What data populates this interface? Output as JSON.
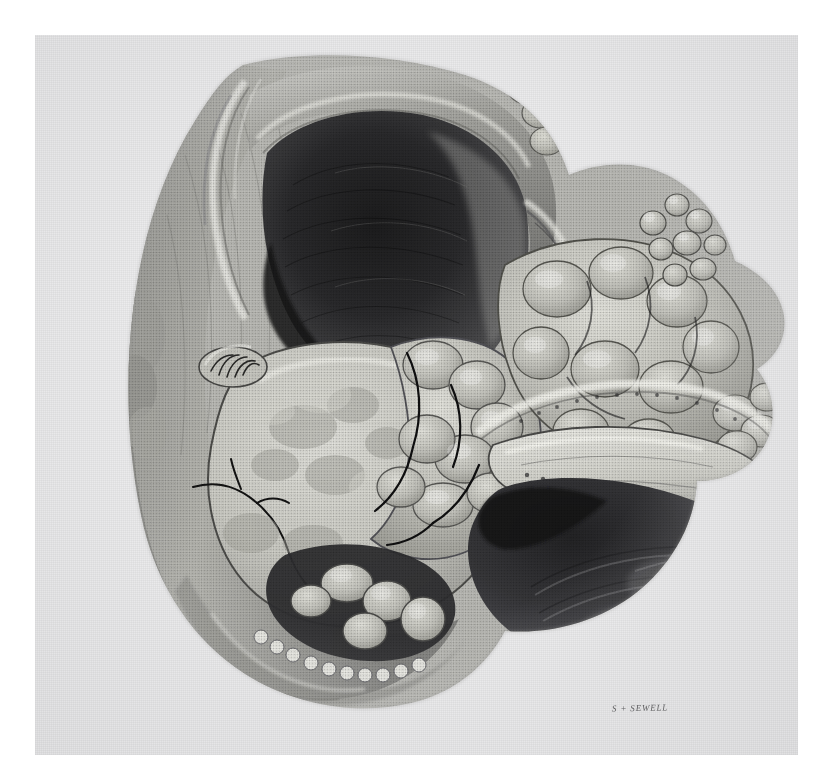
{
  "plate": {
    "kind": "halftone-anatomical-illustration",
    "subject": "Sagittal section of gravid uterus with papillary tumour masses and adjacent bladder cavity",
    "medium": "monochrome halftone print on textured paper",
    "signature": "S + SEWELL",
    "caption": "",
    "paper_color": "#ececed",
    "margin_color": "#ffffff",
    "ink_dark": "#2a2a2c",
    "ink_mid": "#8f8f90",
    "ink_light": "#d6d6d4",
    "plate_bounds": {
      "x": 35,
      "y": 35,
      "width": 763,
      "height": 720
    }
  },
  "regions": [
    {
      "id": "uterine-cavity",
      "label": "Uterine cavity (dark lumen)",
      "tone": "#3a3a3b"
    },
    {
      "id": "myometrium-upper",
      "label": "Upper uterine wall",
      "tone": "#9b9b99"
    },
    {
      "id": "myometrium-left",
      "label": "Left uterine wall / broad ligament",
      "tone": "#a8a8a5"
    },
    {
      "id": "fetal-head",
      "label": "Fetal head in section",
      "tone": "#cfcfc9"
    },
    {
      "id": "tumour-mass-central",
      "label": "Papillary tumour mass, central",
      "tone": "#c8c8c2"
    },
    {
      "id": "tumour-cluster-right",
      "label": "Cauliflower tumour clusters, right",
      "tone": "#b7b7b2"
    },
    {
      "id": "bladder-cavity",
      "label": "Bladder cavity (dark lumen)",
      "tone": "#3f3f40"
    },
    {
      "id": "bladder-wall",
      "label": "Bladder wall with rugae",
      "tone": "#d2d2cc"
    },
    {
      "id": "cervical-canal",
      "label": "Cervical canal / plical folds",
      "tone": "#8a8a88"
    },
    {
      "id": "placental-rim",
      "label": "Placental / decidual rim",
      "tone": "#e2e2dc"
    }
  ]
}
